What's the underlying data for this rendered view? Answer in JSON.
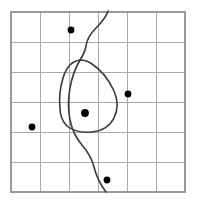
{
  "figure": {
    "title": "",
    "width": 197,
    "height": 206,
    "background_color": "#ffffff"
  },
  "grid": {
    "name": "square-grid",
    "columns": 6,
    "rows": 6,
    "origin_x": 11,
    "origin_y": 12,
    "cell_width": 29,
    "cell_height": 30,
    "line_color": "#a9a9a9",
    "frame_color": "#9a9a9a",
    "vertical_lines_x": [
      11,
      40,
      69,
      98,
      127,
      156,
      185
    ],
    "horizontal_lines_y": [
      12,
      42,
      72,
      102,
      132,
      162,
      192
    ]
  },
  "points": {
    "name": "sample-points",
    "color": "#000000",
    "radius": 3.4,
    "items": [
      {
        "label": "point-top",
        "x": 71,
        "y": 30
      },
      {
        "label": "point-right",
        "x": 128,
        "y": 94
      },
      {
        "label": "point-center",
        "x": 85,
        "y": 113
      },
      {
        "label": "point-left",
        "x": 32,
        "y": 127
      },
      {
        "label": "point-bottom",
        "x": 107,
        "y": 180
      }
    ]
  },
  "curves": {
    "color": "#3a3a3a",
    "stroke_width": 1.6,
    "closed_region": {
      "label": "closed-blob-region",
      "path": "M 80 60 C 72 61 66 68 63 78 C 60 88 59 99 60 108 C 60 115 62 121 67 126 C 73 131 82 133 92 132 C 102 131 110 126 114 118 C 118 110 118 100 114 91 C 109 80 101 70 92 64 C 88 61 84 60 80 60 Z"
    },
    "wavy_line": {
      "label": "wavy-boundary-line",
      "path": "M 108 11 C 106 18 101 23 96 28 C 91 33 87 39 86 46 C 85 52 82 57 80 60 C 76 67 72 76 70 88 C 68 99 68 110 70 120 C 72 130 76 138 82 145 C 88 152 92 159 94 167 C 96 175 100 184 106 192"
    }
  }
}
